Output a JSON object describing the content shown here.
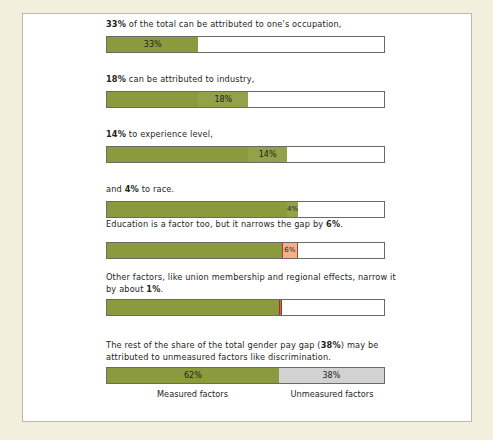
{
  "figure": {
    "background_color": "#f2efdc",
    "panel_color": "#ffffff",
    "green_color": "#8a9a3d",
    "salmon_color": "#f4b08a",
    "red_color": "#d0694a",
    "grey_color": "#d2d2d2"
  },
  "steps": [
    {
      "caption_html": "<b>33%</b> of the total can be attributed to one's occupation,",
      "segments": [
        {
          "label": "33%",
          "start": 0,
          "width": 33,
          "style": "green"
        }
      ]
    },
    {
      "caption_html": "<b>18%</b> can be attributed to industry,",
      "segments": [
        {
          "label": "",
          "start": 0,
          "width": 33,
          "style": "green"
        },
        {
          "label": "18%",
          "start": 33,
          "width": 18,
          "style": "greenlite"
        }
      ]
    },
    {
      "caption_html": "<b>14%</b> to experience level,",
      "segments": [
        {
          "label": "",
          "start": 0,
          "width": 51,
          "style": "green"
        },
        {
          "label": "14%",
          "start": 51,
          "width": 14,
          "style": "greenlite"
        }
      ]
    },
    {
      "caption_html": "and <b>4%</b> to race.",
      "segments": [
        {
          "label": "",
          "start": 0,
          "width": 65,
          "style": "green"
        },
        {
          "label": "4%",
          "start": 65,
          "width": 4,
          "style": "greenlite"
        }
      ]
    },
    {
      "caption_html": "Education is a factor too, but it narrows the gap by <b>6%</b>.",
      "segments": [
        {
          "label": "",
          "start": 0,
          "width": 63,
          "style": "green"
        },
        {
          "label": "6%",
          "start": 63,
          "width": 6,
          "style": "salmon"
        }
      ]
    },
    {
      "caption_html": "Other factors, like union membership and regional effects, narrow it by about <b>1%</b>.",
      "segments": [
        {
          "label": "",
          "start": 0,
          "width": 62,
          "style": "green"
        },
        {
          "label": "",
          "start": 62,
          "width": 1,
          "style": "redline"
        }
      ]
    },
    {
      "caption_html": "The rest of the share of the total gender pay gap (<b>38%</b>) may be attributed to unmeasured factors like discrimination.",
      "segments": [
        {
          "label": "62%",
          "start": 0,
          "width": 62,
          "style": "green"
        },
        {
          "label": "38%",
          "start": 62,
          "width": 38,
          "style": "grey"
        }
      ],
      "axis_labels": [
        {
          "text": "Measured factors",
          "center": 31
        },
        {
          "text": "Unmeasured factors",
          "center": 81
        }
      ]
    }
  ],
  "chart_data": {
    "type": "bar",
    "xlabel": "",
    "ylabel": "",
    "xlim": [
      0,
      100
    ],
    "grid": false,
    "legend_position": "none",
    "orientation": "horizontal",
    "unit": "percent",
    "categories": [
      "Occupation",
      "Industry",
      "Experience level",
      "Race",
      "Education",
      "Other factors (union membership, regional effects)",
      "Unmeasured factors (discrimination)"
    ],
    "values": [
      33,
      18,
      14,
      4,
      -6,
      -1,
      38
    ],
    "annotations": [
      "33% of the total can be attributed to one's occupation,",
      "18% can be attributed to industry,",
      "14% to experience level,",
      "and 4% to race.",
      "Education is a factor too, but it narrows the gap by 6%.",
      "Other factors, like union membership and regional effects, narrow it by about 1%.",
      "The rest of the share of the total gender pay gap (38%) may be attributed to unmeasured factors like discrimination."
    ],
    "cumulative_steps": [
      {
        "step": 1,
        "label": "33%",
        "start": 0,
        "end": 33
      },
      {
        "step": 2,
        "label": "18%",
        "start": 33,
        "end": 51
      },
      {
        "step": 3,
        "label": "14%",
        "start": 51,
        "end": 65
      },
      {
        "step": 4,
        "label": "4%",
        "start": 65,
        "end": 69
      },
      {
        "step": 5,
        "label": "6%",
        "start": 63,
        "end": 69
      },
      {
        "step": 6,
        "label": "1%",
        "start": 62,
        "end": 63
      },
      {
        "step": 7,
        "label": "62% / 38%",
        "start": 0,
        "end": 100
      }
    ],
    "final_split": {
      "measured_factors": 62,
      "unmeasured_factors": 38,
      "measured_label": "Measured factors",
      "unmeasured_label": "Unmeasured factors"
    }
  }
}
